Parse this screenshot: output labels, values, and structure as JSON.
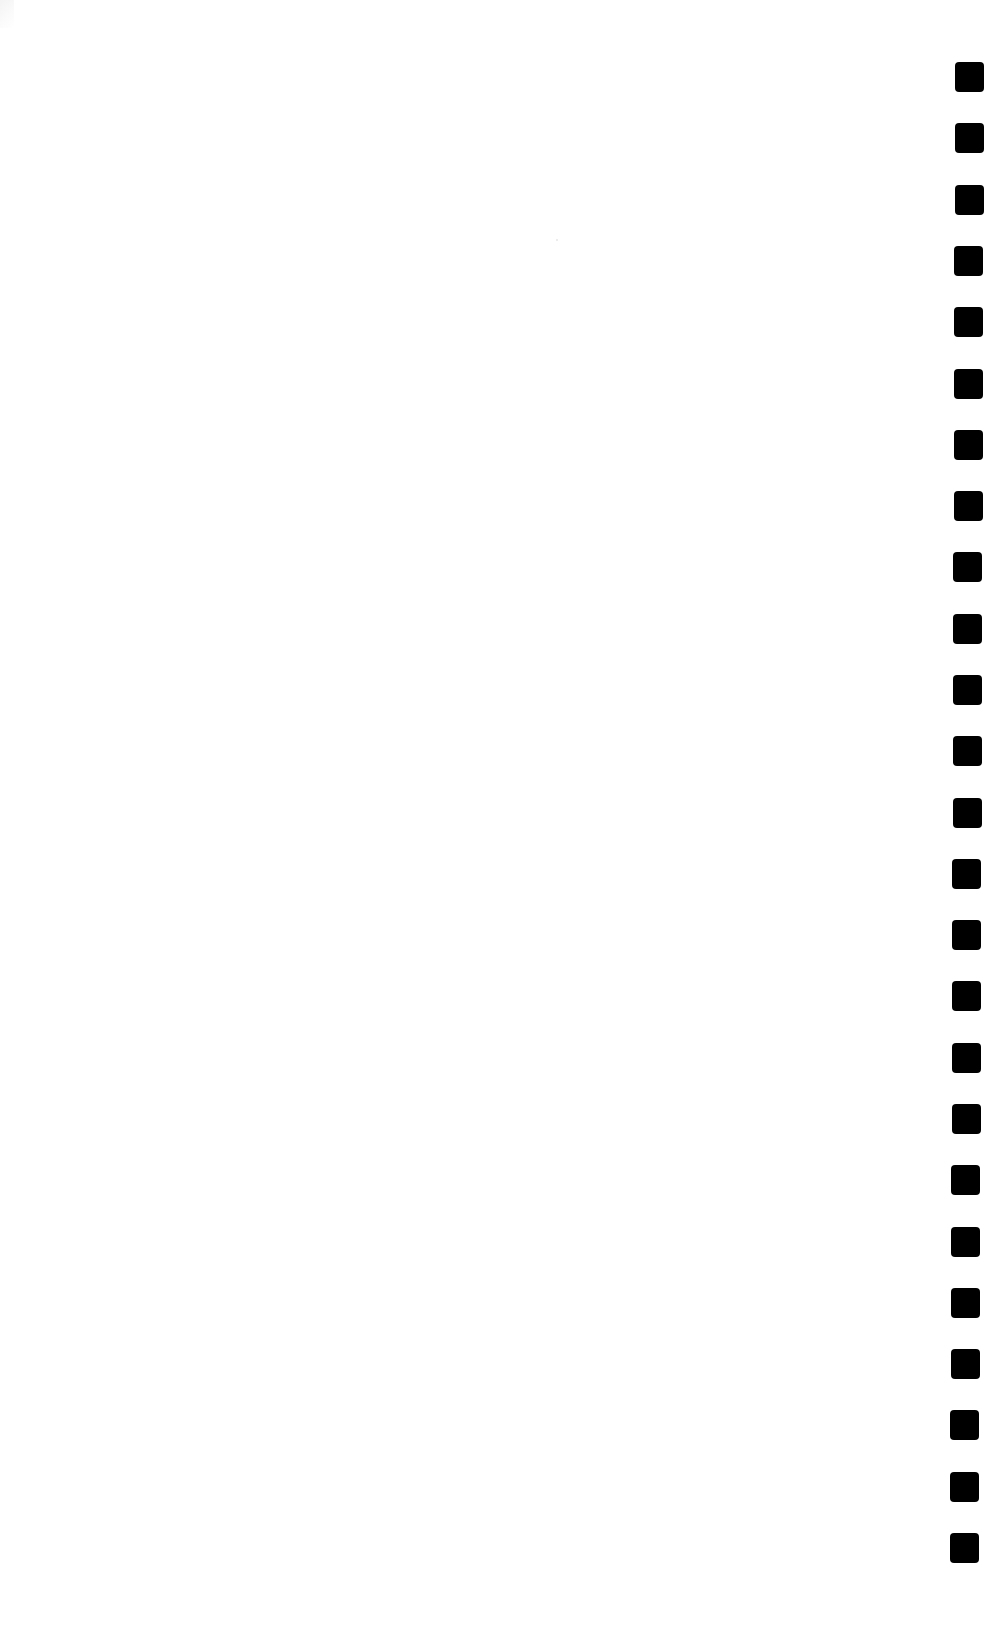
{
  "document": {
    "type": "blank scanned page",
    "background_color": "#ffffff",
    "text_content": ""
  },
  "perforations": {
    "side": "right",
    "count": 25,
    "color": "#000000",
    "shape": "rounded-square",
    "size_px": [
      29,
      30
    ],
    "first_top": 62,
    "last_top": 1533,
    "left_start": 955,
    "left_end": 950
  }
}
